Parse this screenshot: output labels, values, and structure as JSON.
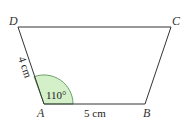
{
  "diagram": {
    "title": "",
    "vertices": {
      "A": {
        "label": "A"
      },
      "B": {
        "label": "B"
      },
      "C": {
        "label": "C"
      },
      "D": {
        "label": "D"
      }
    },
    "side_AD": "4 cm",
    "side_AB": "5 cm",
    "angle_A": "110°",
    "colors": {
      "stroke": "#333333",
      "angle_fill": "#d4f0c8",
      "angle_stroke": "#3a7a3a"
    }
  }
}
